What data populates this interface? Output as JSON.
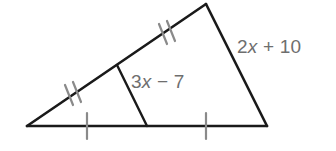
{
  "figure": {
    "kind": "geometry-diagram",
    "background_color": "#ffffff",
    "stroke_color": "#1a1a1a",
    "tick_color": "#8a8a8a",
    "label_color": "#6e6e6e"
  },
  "labels": {
    "right_side": {
      "full_text": "2x + 10",
      "coefficient": "2",
      "variable": "x",
      "operator": "+",
      "constant": "10"
    },
    "midsegment": {
      "full_text": "3x − 7",
      "coefficient": "3",
      "variable": "x",
      "operator": "−",
      "constant": "7"
    }
  },
  "geometry": {
    "vertices": {
      "left": [
        27,
        126
      ],
      "top": [
        206,
        4
      ],
      "bottom_right": [
        267,
        126
      ]
    },
    "midsegment": {
      "from": [
        117,
        65
      ],
      "to": [
        147,
        126
      ]
    },
    "tick_marks": [
      {
        "name": "upper-left-side-double-tick",
        "count": 2,
        "center": [
          166,
          34
        ]
      },
      {
        "name": "lower-left-side-double-tick",
        "count": 2,
        "center": [
          72,
          95
        ]
      },
      {
        "name": "base-left-single-tick",
        "count": 1,
        "center": [
          87,
          126
        ]
      },
      {
        "name": "base-right-single-tick",
        "count": 1,
        "center": [
          206,
          126
        ]
      }
    ]
  }
}
